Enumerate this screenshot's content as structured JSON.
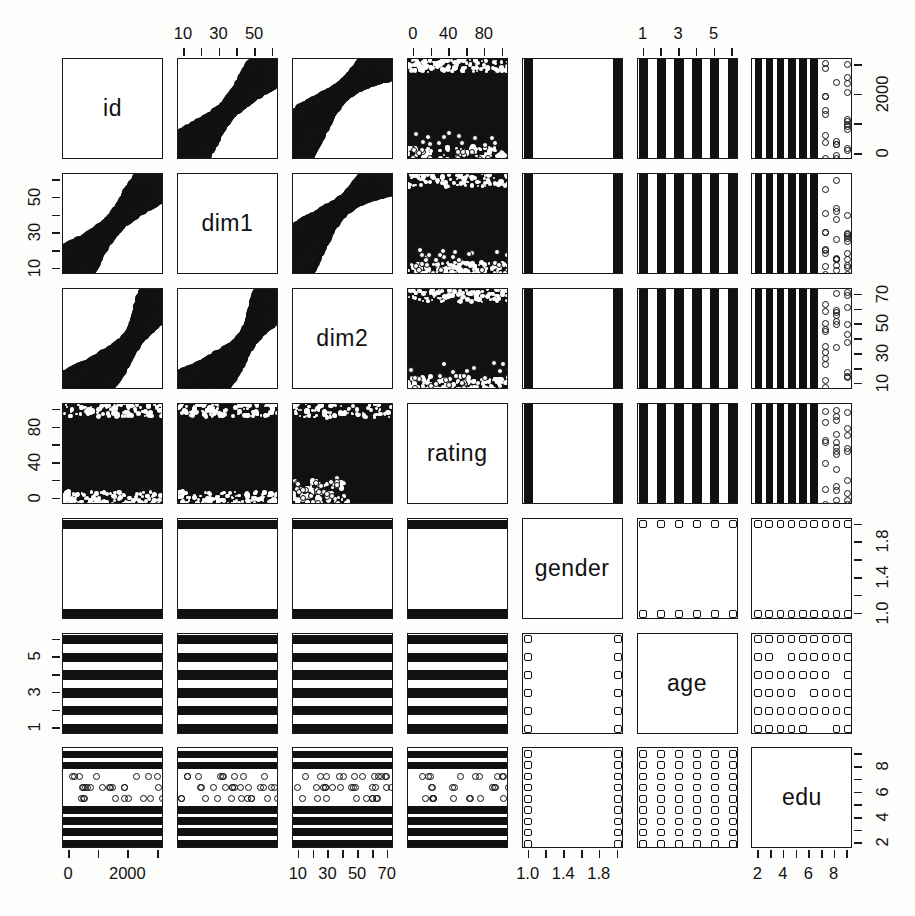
{
  "figure": {
    "type": "scatterplot-matrix",
    "title": "",
    "n_variables": 7,
    "background_color": "#fdfdfc",
    "point_color": "#111111",
    "panel_border_color": "#1a1a1a"
  },
  "variables": [
    {
      "index": 0,
      "name": "id",
      "diag_label": "id",
      "axis_side": "right",
      "tick_labels": [
        "0",
        "2000"
      ],
      "tick_values": [
        0,
        2000
      ],
      "range": [
        0,
        3200
      ],
      "n_ticks": 4,
      "kind": "continuous"
    },
    {
      "index": 1,
      "name": "dim1",
      "diag_label": "dim1",
      "axis_side": "left",
      "tick_labels": [
        "10",
        "30",
        "50"
      ],
      "tick_values": [
        10,
        30,
        50
      ],
      "range": [
        5,
        63
      ],
      "n_ticks": 6,
      "kind": "continuous"
    },
    {
      "index": 2,
      "name": "dim2",
      "diag_label": "dim2",
      "axis_side": "right",
      "tick_labels": [
        "10",
        "30",
        "50",
        "70"
      ],
      "tick_values": [
        10,
        30,
        50,
        70
      ],
      "range": [
        5,
        78
      ],
      "n_ticks": 7,
      "kind": "continuous"
    },
    {
      "index": 3,
      "name": "rating",
      "diag_label": "rating",
      "axis_side": "left",
      "tick_labels": [
        "0",
        "40",
        "80"
      ],
      "tick_values": [
        0,
        40,
        80
      ],
      "range": [
        -5,
        105
      ],
      "n_ticks": 6,
      "kind": "continuous"
    },
    {
      "index": 4,
      "name": "gender",
      "diag_label": "gender",
      "axis_side": "right",
      "tick_labels": [
        "1.0",
        "1.4",
        "1.8"
      ],
      "tick_values": [
        1.0,
        1.4,
        1.8
      ],
      "range": [
        0.96,
        2.04
      ],
      "n_ticks": 6,
      "kind": "discrete",
      "levels": [
        1,
        2
      ]
    },
    {
      "index": 5,
      "name": "age",
      "diag_label": "age",
      "axis_side": "left",
      "tick_labels": [
        "1",
        "3",
        "5"
      ],
      "tick_values": [
        1,
        3,
        5
      ],
      "range": [
        0.8,
        6.2
      ],
      "n_ticks": 6,
      "kind": "discrete",
      "levels": [
        1,
        2,
        3,
        4,
        5,
        6
      ]
    },
    {
      "index": 6,
      "name": "edu",
      "diag_label": "edu",
      "axis_side": "right",
      "tick_labels": [
        "2",
        "4",
        "6",
        "8"
      ],
      "tick_values": [
        2,
        4,
        6,
        8
      ],
      "range": [
        0.8,
        9.2
      ],
      "n_ticks": 8,
      "kind": "discrete",
      "levels": [
        1,
        2,
        3,
        4,
        5,
        6,
        7,
        8,
        9
      ]
    }
  ],
  "top_axes": [
    {
      "col": 1,
      "var": "dim1",
      "labels": [
        "10",
        "30",
        "50"
      ],
      "n_ticks": 6
    },
    {
      "col": 3,
      "var": "rating",
      "labels": [
        "0",
        "40",
        "80"
      ],
      "n_ticks": 6
    },
    {
      "col": 5,
      "var": "age",
      "labels": [
        "1",
        "3",
        "5"
      ],
      "n_ticks": 6
    }
  ],
  "bottom_axes": [
    {
      "col": 0,
      "var": "id",
      "labels": [
        "0",
        "2000"
      ],
      "n_ticks": 4
    },
    {
      "col": 2,
      "var": "dim2",
      "labels": [
        "10",
        "30",
        "50",
        "70"
      ],
      "n_ticks": 7
    },
    {
      "col": 4,
      "var": "gender",
      "labels": [
        "1.0",
        "1.4",
        "1.8"
      ],
      "n_ticks": 6
    },
    {
      "col": 6,
      "var": "edu",
      "labels": [
        "2",
        "4",
        "6",
        "8"
      ],
      "n_ticks": 8
    }
  ],
  "left_axes": [
    {
      "row": 1,
      "var": "dim1",
      "labels": [
        "10",
        "30",
        "50"
      ],
      "n_ticks": 6
    },
    {
      "row": 3,
      "var": "rating",
      "labels": [
        "0",
        "40",
        "80"
      ],
      "n_ticks": 6
    },
    {
      "row": 5,
      "var": "age",
      "labels": [
        "1",
        "3",
        "5"
      ],
      "n_ticks": 6
    }
  ],
  "right_axes": [
    {
      "row": 0,
      "var": "id",
      "labels": [
        "0",
        "2000"
      ],
      "n_ticks": 4
    },
    {
      "row": 2,
      "var": "dim2",
      "labels": [
        "10",
        "30",
        "50",
        "70"
      ],
      "n_ticks": 7
    },
    {
      "row": 4,
      "var": "gender",
      "labels": [
        "1.0",
        "1.4",
        "1.8"
      ],
      "n_ticks": 6
    },
    {
      "row": 6,
      "var": "edu",
      "labels": [
        "2",
        "4",
        "6",
        "8"
      ],
      "n_ticks": 8
    }
  ],
  "chart_data": {
    "type": "scatter",
    "subtype": "scatterplot-matrix",
    "title": "",
    "xlabel": "",
    "ylabel": "",
    "grid": false,
    "legend": "none",
    "variables": [
      "id",
      "dim1",
      "dim2",
      "rating",
      "gender",
      "age",
      "edu"
    ],
    "axis_ranges": {
      "id": [
        0,
        3200
      ],
      "dim1": [
        5,
        63
      ],
      "dim2": [
        5,
        78
      ],
      "rating": [
        -5,
        105
      ],
      "gender": [
        0.96,
        2.04
      ],
      "age": [
        0.8,
        6.2
      ],
      "edu": [
        0.8,
        9.2
      ]
    },
    "tick_labels": {
      "id": [
        "0",
        "2000"
      ],
      "dim1": [
        "10",
        "30",
        "50"
      ],
      "dim2": [
        "10",
        "30",
        "50",
        "70"
      ],
      "rating": [
        "0",
        "40",
        "80"
      ],
      "gender": [
        "1.0",
        "1.4",
        "1.8"
      ],
      "age": [
        "1",
        "3",
        "5"
      ],
      "edu": [
        "2",
        "4",
        "6",
        "8"
      ]
    },
    "panel_descriptions": [
      {
        "row": "id",
        "col": "dim1",
        "pattern": "dense positive diagonal band"
      },
      {
        "row": "id",
        "col": "dim2",
        "pattern": "dense concave increasing band"
      },
      {
        "row": "id",
        "col": "rating",
        "pattern": "saturated full-panel cloud"
      },
      {
        "row": "id",
        "col": "gender",
        "pattern": "two vertical bars at edges"
      },
      {
        "row": "id",
        "col": "age",
        "pattern": "six vertical stripes"
      },
      {
        "row": "id",
        "col": "edu",
        "pattern": "nine vertical stripes, sparse at high edu"
      },
      {
        "row": "dim1",
        "col": "dim2",
        "pattern": "dense concave increasing band"
      },
      {
        "row": "dim1",
        "col": "rating",
        "pattern": "saturated full-panel cloud"
      },
      {
        "row": "dim2",
        "col": "rating",
        "pattern": "saturated cloud, sparse lower-left"
      },
      {
        "row": "gender",
        "col": "any",
        "pattern": "two horizontal bars at edges"
      },
      {
        "row": "age",
        "col": "any",
        "pattern": "six horizontal stripes"
      },
      {
        "row": "edu",
        "col": "any",
        "pattern": "nine horizontal stripes, sparse mid rows"
      },
      {
        "row": "gender",
        "col": "age",
        "pattern": "open circles on 2x6 lattice"
      },
      {
        "row": "gender",
        "col": "edu",
        "pattern": "open circles on 2x9 lattice"
      },
      {
        "row": "age",
        "col": "edu",
        "pattern": "open circles on 6x9 lattice"
      }
    ],
    "correlation_notes": [
      "id vs dim1: strong positive, tight band",
      "id vs dim2: strong positive, curved (concave up)",
      "dim1 vs dim2: strong positive, curved",
      "rating vs id/dim1/dim2: uniform dense fill, no clear relation",
      "gender/age/edu: discrete factor levels produce striped and lattice patterns"
    ]
  }
}
